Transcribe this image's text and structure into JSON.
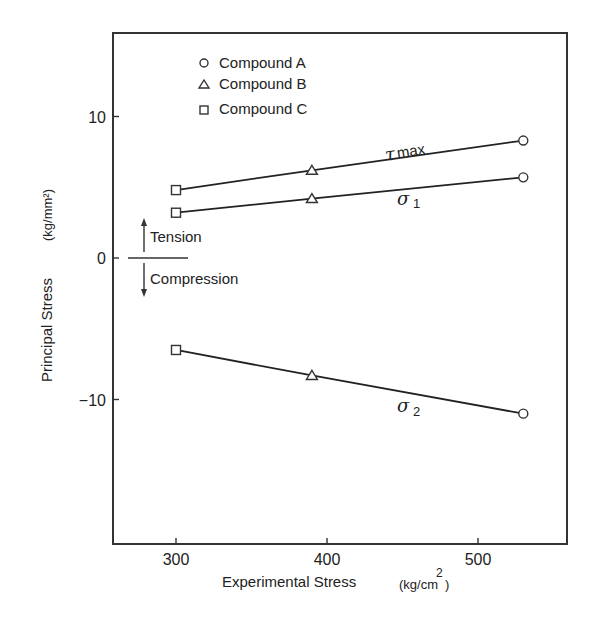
{
  "chart_data": {
    "type": "line",
    "title": "",
    "xlabel": "Experimental Stress (kg/cm²)",
    "xlabel_main": "Experimental Stress",
    "xlabel_unit": "(kg/cm",
    "xlabel_sup": "2",
    "xlabel_close": ")",
    "ylabel": "Principal Stress (kg/mm²)",
    "ylabel_main": "Principal Stress",
    "ylabel_unit": "(kg/mm²)",
    "xlim": [
      259,
      560
    ],
    "ylim": [
      -20,
      16
    ],
    "xticks": [
      300,
      400,
      500
    ],
    "yticks": [
      10,
      0,
      -10
    ],
    "ytick_labels": [
      "10",
      "0",
      "−10"
    ],
    "grid": false,
    "legend_position": "upper left (inside)",
    "legend": [
      {
        "marker": "circle",
        "label": "Compound A"
      },
      {
        "marker": "triangle",
        "label": "Compound B"
      },
      {
        "marker": "square",
        "label": "Compound C"
      }
    ],
    "x": [
      300,
      390,
      530
    ],
    "point_markers": [
      "square",
      "triangle",
      "circle"
    ],
    "series": [
      {
        "name": "τmax",
        "label_main": "τ",
        "label_sub": "max",
        "values": [
          4.8,
          6.2,
          8.3
        ]
      },
      {
        "name": "σ1",
        "label_main": "σ",
        "label_sub": "1",
        "values": [
          3.2,
          4.2,
          5.7
        ]
      },
      {
        "name": "σ2",
        "label_main": "σ",
        "label_sub": "2",
        "values": [
          -6.5,
          -8.3,
          -11.0
        ]
      }
    ],
    "annotations": {
      "tension": "Tension",
      "compression": "Compression"
    }
  }
}
